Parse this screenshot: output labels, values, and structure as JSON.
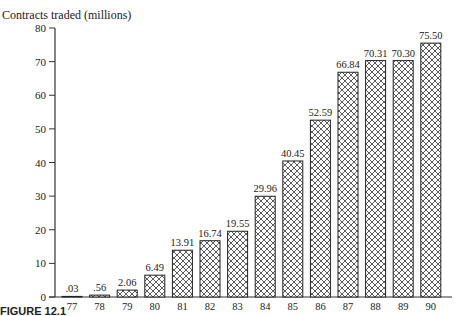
{
  "chart_data": {
    "type": "bar",
    "title": "",
    "ylabel": "Contracts traded (millions)",
    "xlabel": "",
    "categories": [
      "77",
      "78",
      "79",
      "80",
      "81",
      "82",
      "83",
      "84",
      "85",
      "86",
      "87",
      "88",
      "89",
      "90"
    ],
    "values": [
      0.03,
      0.56,
      2.06,
      6.49,
      13.91,
      16.74,
      19.55,
      29.96,
      40.45,
      52.59,
      66.84,
      70.31,
      70.3,
      75.5
    ],
    "value_labels": [
      ".03",
      ".56",
      "2.06",
      "6.49",
      "13.91",
      "16.74",
      "19.55",
      "29.96",
      "40.45",
      "52.59",
      "66.84",
      "70.31",
      "70.30",
      "75.50"
    ],
    "ylim": [
      0,
      80
    ],
    "yticks": [
      0,
      10,
      20,
      30,
      40,
      50,
      60,
      70,
      80
    ],
    "grid": false,
    "legend": null,
    "bar_fill": "crosshatch",
    "caption": "FIGURE 12.1"
  }
}
